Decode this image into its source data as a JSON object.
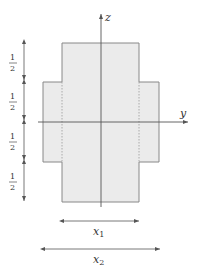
{
  "diagram": {
    "type": "cross-section",
    "axes": {
      "vertical_label": "z",
      "horizontal_label": "y"
    },
    "dimension_labels": {
      "left_segments": [
        "1/2",
        "1/2",
        "1/2",
        "1/2"
      ],
      "bottom_inner": "x",
      "bottom_inner_sub": "1",
      "bottom_outer": "x",
      "bottom_outer_sub": "2"
    },
    "colors": {
      "fill": "#ebebeb",
      "stroke": "#888888",
      "axis": "#555555",
      "text": "#333333"
    }
  }
}
